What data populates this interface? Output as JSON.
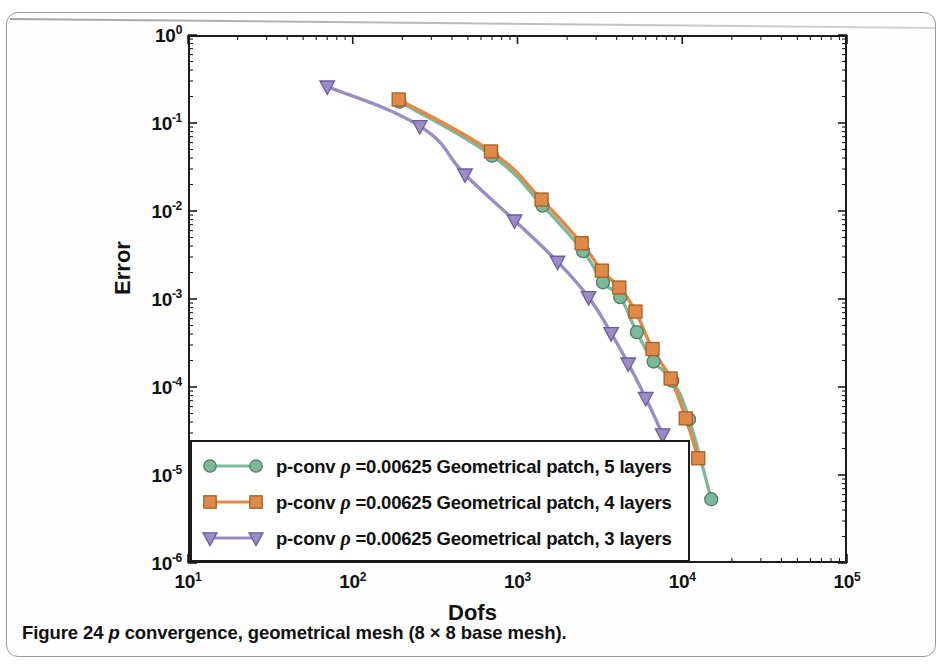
{
  "figure": {
    "caption_prefix": "Figure 24 ",
    "caption_italic": "p",
    "caption_rest": " convergence, geometrical mesh (8 × 8 base mesh)."
  },
  "axes": {
    "x_title": "Dofs",
    "y_title": "Error",
    "x_ticks": [
      "10",
      "10",
      "10",
      "10",
      "10"
    ],
    "x_exponents": [
      "1",
      "2",
      "3",
      "4",
      "5"
    ],
    "y_ticks": [
      "10",
      "10",
      "10",
      "10",
      "10",
      "10",
      "10"
    ],
    "y_exponents": [
      "0",
      "-1",
      "-2",
      "-3",
      "-4",
      "-5",
      "-6"
    ]
  },
  "legend": {
    "items": [
      {
        "label_pre": "p-conv ",
        "rho": "ρ",
        "label_post": " =0.00625 Geometrical patch, 5 layers",
        "color": "#7cb89a",
        "marker": "circle"
      },
      {
        "label_pre": "p-conv ",
        "rho": "ρ",
        "label_post": " =0.00625 Geometrical patch, 4 layers",
        "color": "#e08a4a",
        "marker": "square"
      },
      {
        "label_pre": "p-conv ",
        "rho": "ρ",
        "label_post": " =0.00625 Geometrical patch, 3 layers",
        "color": "#9b8cc4",
        "marker": "triangle-down"
      }
    ]
  },
  "chart_data": {
    "type": "line",
    "xlabel": "Dofs",
    "ylabel": "Error",
    "xscale": "log",
    "yscale": "log",
    "xlim": [
      10,
      100000
    ],
    "ylim": [
      1e-06,
      1
    ],
    "grid": false,
    "legend_position": "lower-left-inside",
    "series": [
      {
        "name": "p-conv rho=0.00625 Geometrical patch, 5 layers",
        "color": "#7cb89a",
        "marker": "circle",
        "x": [
          192,
          700,
          1420,
          2500,
          3300,
          4200,
          5300,
          6700,
          8700,
          11000,
          15000
        ],
        "y": [
          0.175,
          0.0425,
          0.0115,
          0.0035,
          0.00155,
          0.00105,
          0.00042,
          0.000195,
          0.000118,
          4.3e-05,
          5.3e-06
        ]
      },
      {
        "name": "p-conv rho=0.00625 Geometrical patch, 4 layers",
        "color": "#e08a4a",
        "marker": "square",
        "x": [
          190,
          690,
          1400,
          2450,
          3250,
          4150,
          5200,
          6600,
          8500,
          10500,
          12500
        ],
        "y": [
          0.185,
          0.0475,
          0.0135,
          0.0043,
          0.0021,
          0.00135,
          0.00072,
          0.00027,
          0.000125,
          4.4e-05,
          1.55e-05
        ]
      },
      {
        "name": "p-conv rho=0.00625 Geometrical patch, 3 layers",
        "color": "#9b8cc4",
        "marker": "triangle-down",
        "x": [
          70,
          255,
          480,
          960,
          1750,
          2700,
          3700,
          4700,
          6000,
          7600
        ],
        "y": [
          0.26,
          0.092,
          0.026,
          0.0078,
          0.00265,
          0.00105,
          0.00041,
          0.000185,
          7.5e-05,
          2.9e-05
        ]
      }
    ]
  }
}
